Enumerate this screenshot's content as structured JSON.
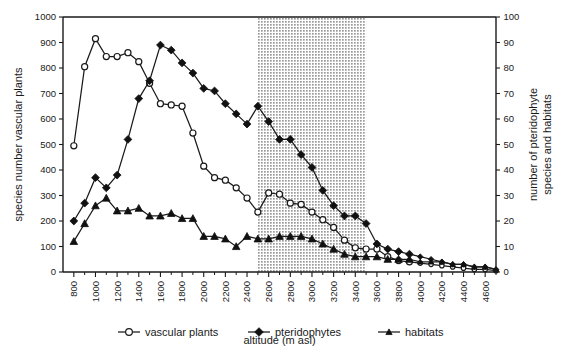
{
  "chart_data": {
    "type": "line",
    "title": "",
    "xlabel": "altitude (m asl)",
    "ylabel": "species number vascular plants",
    "y2label": "number of pteridophyte species and habitats",
    "xlim": [
      700,
      4700
    ],
    "ylim": [
      0,
      1000
    ],
    "y2lim": [
      0,
      100
    ],
    "xticks": [
      800,
      1000,
      1200,
      1400,
      1600,
      1800,
      2000,
      2200,
      2400,
      2600,
      2800,
      3000,
      3200,
      3400,
      3600,
      3800,
      4000,
      4200,
      4400,
      4600
    ],
    "xtick_step_minor": 100,
    "yticks": [
      0,
      100,
      200,
      300,
      400,
      500,
      600,
      700,
      800,
      900,
      1000
    ],
    "y2ticks": [
      0,
      10,
      20,
      30,
      40,
      50,
      60,
      70,
      80,
      90,
      100
    ],
    "grid": false,
    "legend_position": "bottom",
    "shaded_band": {
      "from": 2500,
      "to": 3500,
      "fill": "#c8c8c8",
      "pattern": "dotted"
    },
    "x": [
      800,
      900,
      1000,
      1100,
      1200,
      1300,
      1400,
      1500,
      1600,
      1700,
      1800,
      1900,
      2000,
      2100,
      2200,
      2300,
      2400,
      2500,
      2600,
      2700,
      2800,
      2900,
      3000,
      3100,
      3200,
      3300,
      3400,
      3500,
      3600,
      3700,
      3800,
      3900,
      4000,
      4100,
      4200,
      4300,
      4400,
      4500,
      4600,
      4700
    ],
    "series": [
      {
        "name": "vascular plants",
        "axis": "left",
        "marker": "open-circle",
        "values": [
          495,
          805,
          915,
          845,
          845,
          860,
          825,
          740,
          660,
          655,
          650,
          545,
          415,
          370,
          360,
          330,
          290,
          235,
          310,
          305,
          270,
          265,
          235,
          205,
          175,
          125,
          95,
          90,
          90,
          60,
          45,
          40,
          35,
          30,
          25,
          20,
          15,
          10,
          10,
          5
        ]
      },
      {
        "name": "pteridophytes",
        "axis": "right",
        "marker": "filled-diamond",
        "values": [
          20,
          27,
          37,
          33,
          38,
          52,
          68,
          75,
          89,
          87,
          82,
          78,
          72,
          71,
          66,
          62,
          58,
          65,
          59,
          52,
          52,
          46,
          41,
          32,
          26,
          22,
          22,
          19,
          11,
          9,
          8,
          7,
          6,
          5,
          4,
          3,
          3,
          2,
          2,
          1
        ]
      },
      {
        "name": "habitats",
        "axis": "right",
        "marker": "filled-triangle",
        "values": [
          12,
          19,
          26,
          29,
          24,
          24,
          25,
          22,
          22,
          23,
          21,
          21,
          14,
          14,
          13,
          10,
          14,
          13,
          13,
          14,
          14,
          14,
          13,
          11,
          9,
          7,
          6,
          6,
          6,
          5,
          5,
          5,
          4,
          4,
          4,
          3,
          3,
          2,
          2,
          1
        ]
      }
    ]
  },
  "legend": {
    "items": [
      {
        "label": "vascular plants",
        "marker": "open-circle"
      },
      {
        "label": "pteridophytes",
        "marker": "filled-diamond"
      },
      {
        "label": "habitats",
        "marker": "filled-triangle"
      }
    ]
  }
}
